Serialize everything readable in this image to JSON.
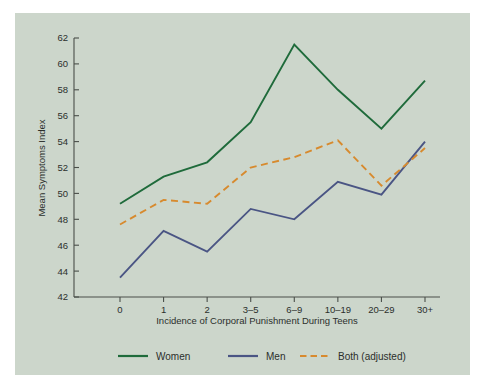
{
  "figure": {
    "background_color": "#ffffff",
    "panel_color": "#ccd6cb"
  },
  "chart_data": {
    "type": "line",
    "title": "",
    "xlabel": "Incidence of Corporal Punishment During Teens",
    "ylabel": "Mean Symptoms Index",
    "categories": [
      "0",
      "1",
      "2",
      "3–5",
      "6–9",
      "10–19",
      "20–29",
      "30+"
    ],
    "ylim": [
      42,
      62
    ],
    "yticks": [
      42,
      44,
      46,
      48,
      50,
      52,
      54,
      56,
      58,
      60,
      62
    ],
    "grid": false,
    "legend_position": "bottom",
    "series": [
      {
        "name": "Women",
        "color": "#1f6b3b",
        "style": "solid",
        "values": [
          49.2,
          51.3,
          52.4,
          55.5,
          61.5,
          58.0,
          55.0,
          58.7
        ]
      },
      {
        "name": "Men",
        "color": "#4a5584",
        "style": "solid",
        "values": [
          43.5,
          47.1,
          45.5,
          48.8,
          48.0,
          50.9,
          49.9,
          54.0
        ]
      },
      {
        "name": "Both (adjusted)",
        "color": "#d78a2e",
        "style": "dashed",
        "values": [
          47.6,
          49.5,
          49.2,
          52.0,
          52.8,
          54.1,
          50.6,
          53.5
        ]
      }
    ]
  },
  "axis": {
    "y_tick_labels": [
      "42",
      "44",
      "46",
      "48",
      "50",
      "52",
      "54",
      "56",
      "58",
      "60",
      "62"
    ],
    "x_tick_labels": [
      "0",
      "1",
      "2",
      "3–5",
      "6–9",
      "10–19",
      "20–29",
      "30+"
    ],
    "y_title": "Mean Symptoms Index",
    "x_title": "Incidence of Corporal Punishment During Teens"
  },
  "legend": {
    "items": [
      {
        "label": "Women",
        "color": "#1f6b3b",
        "style": "solid"
      },
      {
        "label": "Men",
        "color": "#4a5584",
        "style": "solid"
      },
      {
        "label": "Both (adjusted)",
        "color": "#d78a2e",
        "style": "dashed"
      }
    ]
  }
}
